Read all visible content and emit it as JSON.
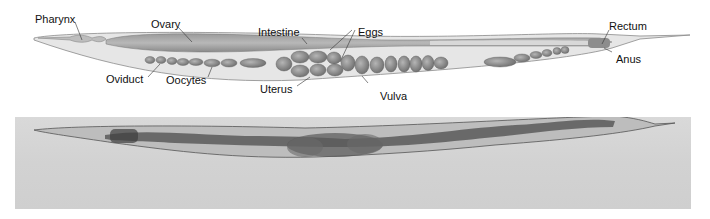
{
  "figure": {
    "panels": [
      {
        "id": "schematic",
        "type": "labeled-diagram"
      },
      {
        "id": "micrograph",
        "type": "photograph"
      }
    ]
  },
  "labels": {
    "pharynx": "Pharynx",
    "ovary": "Ovary",
    "intestine": "Intestine",
    "eggs": "Eggs",
    "rectum": "Rectum",
    "anus": "Anus",
    "oviduct": "Oviduct",
    "oocytes": "Oocytes",
    "uterus": "Uterus",
    "vulva": "Vulva"
  },
  "colors": {
    "body_fill": "#e4e4e4",
    "body_outline": "#8a8a8a",
    "organ_fill": "#8c8c8c",
    "egg_fill": "#7e7e7e",
    "photo_bg": "#d4d4d4"
  }
}
